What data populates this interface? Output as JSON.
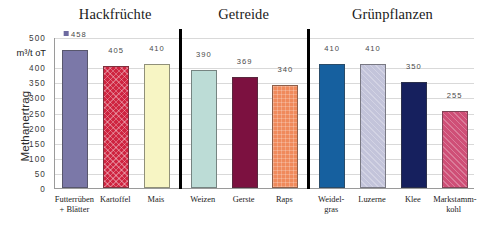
{
  "chart_data": {
    "type": "bar",
    "title": "",
    "xlabel": "",
    "ylabel": "Methanertrag",
    "unit_label": "m³/t oT",
    "ylim": [
      0,
      500
    ],
    "grid": true,
    "legend_position": "none",
    "yticks": [
      "0",
      "50",
      "100",
      "150",
      "200",
      "250",
      "300",
      "350",
      "400",
      "500"
    ],
    "ytick_values": [
      0,
      50,
      100,
      150,
      200,
      250,
      300,
      350,
      400,
      500
    ],
    "groups": [
      {
        "name": "Hackfrüchte"
      },
      {
        "name": "Getreide"
      },
      {
        "name": "Grünpflanzen"
      }
    ],
    "categories": [
      "Futterrüben\n+ Blätter",
      "Kartoffel",
      "Mais",
      "Weizen",
      "Gerste",
      "Raps",
      "Weidel-\ngras",
      "Luzerne",
      "Klee",
      "Markstamm-\nkohl"
    ],
    "values": [
      458,
      405,
      410,
      390,
      369,
      340,
      410,
      410,
      350,
      255
    ],
    "value_labels": [
      "458",
      "405",
      "410",
      "390",
      "369",
      "340",
      "410",
      "410",
      "350",
      "255"
    ],
    "colors": [
      "#7b78a8",
      "#cf2440",
      "#f7f5c4",
      "#bcdcd6",
      "#7c1140",
      "#f08a5c",
      "#16609f",
      "#c3c4da",
      "#16205e",
      "#cf4f77"
    ],
    "textures": [
      "none",
      "cross",
      "none",
      "none",
      "none",
      "grid",
      "none",
      "diag",
      "none",
      "diag"
    ],
    "group_index": [
      0,
      0,
      0,
      1,
      1,
      1,
      2,
      2,
      2,
      2
    ],
    "first_bar_has_marker": true,
    "marker_color": "#6d6aa0"
  }
}
